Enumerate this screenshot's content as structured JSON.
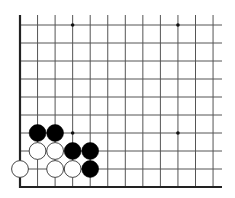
{
  "board": {
    "type": "go-board-corner",
    "visible_corner": "bottom-left",
    "columns": 12,
    "rows": 10,
    "origin_x": 20,
    "origin_y": 25,
    "spacing_x": 17.55,
    "spacing_y": 18,
    "line_color": "#555555",
    "edge_color": "#222222",
    "star_points": [
      [
        3,
        0
      ],
      [
        9,
        0
      ],
      [
        3,
        6
      ],
      [
        9,
        6
      ]
    ],
    "stones": [
      {
        "color": "black",
        "col": 1,
        "row": 6
      },
      {
        "color": "black",
        "col": 2,
        "row": 6
      },
      {
        "color": "white",
        "col": 1,
        "row": 7
      },
      {
        "color": "white",
        "col": 2,
        "row": 7
      },
      {
        "color": "black",
        "col": 3,
        "row": 7
      },
      {
        "color": "black",
        "col": 4,
        "row": 7
      },
      {
        "color": "white",
        "col": 0,
        "row": 8
      },
      {
        "color": "white",
        "col": 2,
        "row": 8
      },
      {
        "color": "white",
        "col": 3,
        "row": 8
      },
      {
        "color": "black",
        "col": 4,
        "row": 8
      }
    ]
  }
}
